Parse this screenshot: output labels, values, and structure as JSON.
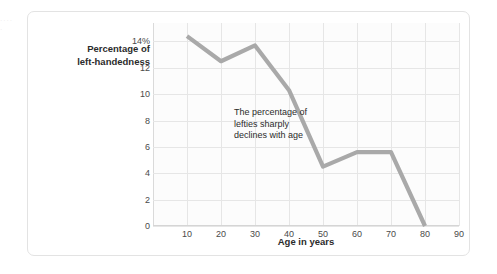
{
  "bleed_text": "·  ·  ·  ·  ·",
  "chart_data": {
    "type": "line",
    "title": "",
    "xlabel": "Age in years",
    "ylabel": "Percentage of left-handedness",
    "ylabel_lines": [
      "Percentage of",
      "left-handedness"
    ],
    "x": [
      10,
      20,
      30,
      40,
      50,
      60,
      70,
      80
    ],
    "values": [
      14.4,
      12.5,
      13.7,
      10.3,
      4.5,
      5.6,
      5.6,
      0
    ],
    "series": [
      {
        "name": "Percentage of left-handedness",
        "values": [
          14.4,
          12.5,
          13.7,
          10.3,
          4.5,
          5.6,
          5.6,
          0
        ]
      }
    ],
    "xlim": [
      0,
      90
    ],
    "ylim": [
      0,
      15.4
    ],
    "xticks": [
      10,
      20,
      30,
      40,
      50,
      60,
      70,
      80,
      90
    ],
    "xtick_labels": [
      "10",
      "20",
      "30",
      "40",
      "50",
      "60",
      "70",
      "80",
      "90"
    ],
    "yticks": [
      0,
      2,
      4,
      6,
      8,
      10,
      12,
      14
    ],
    "ytick_labels": [
      "0",
      "2",
      "4",
      "6",
      "8",
      "10",
      "12",
      "14%"
    ],
    "grid": true,
    "legend": "none",
    "line_color": "#a9a9a9",
    "grid_color": "#e6e6e6",
    "plot_bg": "#fcfcfc",
    "annotations": [
      {
        "text": "The percentage of lefties sharply declines with age",
        "lines": [
          "The percentage of",
          "lefties sharply",
          "declines with age"
        ],
        "x": 57,
        "y": 8.5
      }
    ]
  }
}
